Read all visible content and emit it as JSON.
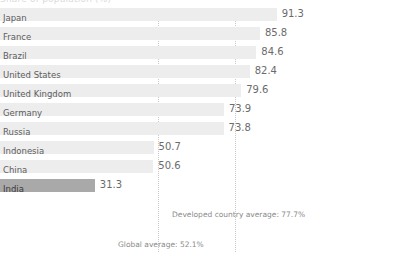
{
  "chart_data": {
    "type": "bar",
    "title": "Share of population (%)",
    "orientation": "horizontal",
    "xlabel": "",
    "ylabel": "",
    "xlim": [
      0,
      100
    ],
    "grid": true,
    "legend": null,
    "categories": [
      "Japan",
      "France",
      "Brazil",
      "United States",
      "United Kingdom",
      "Germany",
      "Russia",
      "Indonesia",
      "China",
      "India"
    ],
    "values": [
      91.3,
      85.8,
      84.6,
      82.4,
      79.6,
      73.9,
      73.8,
      50.7,
      50.6,
      31.3
    ],
    "value_labels": [
      "91.3",
      "85.8",
      "84.6",
      "82.4",
      "79.6",
      "73.9",
      "73.8",
      "50.7",
      "50.6",
      "31.3"
    ],
    "highlight_category": "India",
    "colors": {
      "bar": "#ededed",
      "bar_highlight": "#a9a9a9",
      "gridline": "#c9c9c9",
      "label_text": "#5d5d5d",
      "value_text": "#6b6b6b",
      "annotation_text": "#8a8a8a",
      "background": "#ffffff"
    },
    "reference_lines": [
      {
        "name": "global-average",
        "value": 52.1,
        "label": "Global average: 52.1%"
      },
      {
        "name": "developed-country-average",
        "value": 77.7,
        "label": "Developed country average: 77.7%"
      }
    ]
  },
  "annotations": {
    "developed": "Developed country average: 77.7%",
    "global": "Global average: 52.1%"
  }
}
